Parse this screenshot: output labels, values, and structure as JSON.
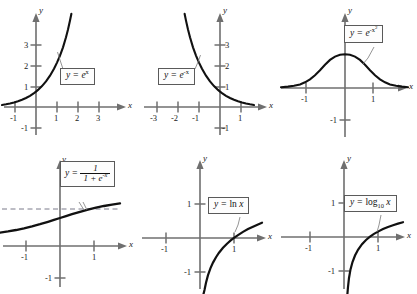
{
  "figure": {
    "panel_count": 6
  },
  "axis_labels": {
    "x": "x",
    "y": "y"
  },
  "panels": [
    {
      "id": "panel-exp-x",
      "formula_parts": {
        "lhs": "y =",
        "base": "e",
        "exponent": "x"
      },
      "formula_text": "y = e^x",
      "x_ticks": [
        "-1",
        "1",
        "2",
        "3"
      ],
      "y_ticks": [
        "1",
        "2",
        "3",
        "-1"
      ]
    },
    {
      "id": "panel-exp-neg-x",
      "formula_parts": {
        "lhs": "y =",
        "base": "e",
        "exponent": "-x"
      },
      "formula_text": "y = e^-x",
      "x_ticks": [
        "-3",
        "-2",
        "-1",
        "1"
      ],
      "y_ticks": [
        "1",
        "2",
        "3",
        "-1"
      ]
    },
    {
      "id": "panel-gaussian",
      "formula_parts": {
        "lhs": "y =",
        "base": "e",
        "exponent": "-x",
        "exponent_power": "2"
      },
      "formula_text": "y = e^(-x^2)",
      "x_ticks": [
        "-1",
        "1"
      ],
      "y_ticks": [
        "-1"
      ]
    },
    {
      "id": "panel-logistic",
      "formula_parts": {
        "lhs": "y =",
        "numerator": "1",
        "denominator_a": "1 +",
        "denominator_base": "e",
        "denominator_exponent": "-x"
      },
      "formula_text": "y = 1 / (1 + e^-x)",
      "x_ticks": [
        "-1",
        "1"
      ],
      "y_ticks": [
        "-1"
      ],
      "asymptote": "dashed horizontal asymptote at y = 1"
    },
    {
      "id": "panel-ln",
      "formula_parts": {
        "lhs": "y =",
        "fn": "ln",
        "arg": "x"
      },
      "formula_text": "y = ln x",
      "x_ticks": [
        "-1",
        "1"
      ],
      "y_ticks": [
        "1",
        "-1"
      ]
    },
    {
      "id": "panel-log10",
      "formula_parts": {
        "lhs": "y =",
        "fn": "log",
        "fn_sub": "10",
        "arg": "x"
      },
      "formula_text": "y = log_10 x",
      "x_ticks": [
        "-1",
        "1"
      ],
      "y_ticks": [
        "1",
        "-1"
      ]
    }
  ],
  "colors": {
    "curve": "#111111",
    "axis": "#6f6f6f",
    "tick_text": "#1a1a1a",
    "callout_border": "#5a5a5a",
    "callout_bg": "#fdfdfd",
    "asymptote": "#7a7a8a",
    "background": "#ffffff"
  }
}
